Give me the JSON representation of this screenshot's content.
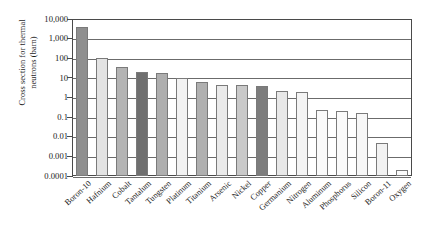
{
  "chart_data": {
    "type": "bar",
    "title": "",
    "xlabel": "",
    "ylabel": "Cross section for thermal\nneutrons (barn)",
    "yscale": "log",
    "ylim": [
      0.0001,
      10000
    ],
    "grid": true,
    "legend": "none",
    "ytick_labels": [
      "10,000",
      "1,000",
      "100",
      "10",
      "1",
      "0.1",
      "0.01",
      "0.001",
      "0.0001"
    ],
    "ytick_values": [
      10000,
      1000,
      100,
      10,
      1,
      0.1,
      0.01,
      0.001,
      0.0001
    ],
    "categories": [
      "Boron-10",
      "Hafnium",
      "Cobalt",
      "Tantalum",
      "Tungsten",
      "Platinum",
      "Titanium",
      "Arsenic",
      "Nickel",
      "Copper",
      "Germanium",
      "Nitrogen",
      "Aluminum",
      "Phosphorus",
      "Silicon",
      "Boron-11",
      "Oxygen"
    ],
    "values": [
      3800,
      105,
      37,
      20,
      18,
      10,
      6.1,
      4.3,
      4.5,
      3.8,
      2.2,
      1.9,
      0.23,
      0.2,
      0.17,
      0.005,
      0.0002
    ],
    "bar_colors": [
      "#8f8f8f",
      "#e3e3e3",
      "#b4b4b4",
      "#6f6f6f",
      "#aeaeae",
      "#f2f2f2",
      "#b0b0b0",
      "#eaeaea",
      "#c9c9c9",
      "#7d7d7d",
      "#e8e8e8",
      "#f4f4f4",
      "#fafafa",
      "#fafafa",
      "#f7f7f7",
      "#f2f2f2",
      "#fbfbfb"
    ]
  },
  "axes": {
    "frame_color": "#4a4a4a",
    "grid_color": "#6b6b6b"
  }
}
